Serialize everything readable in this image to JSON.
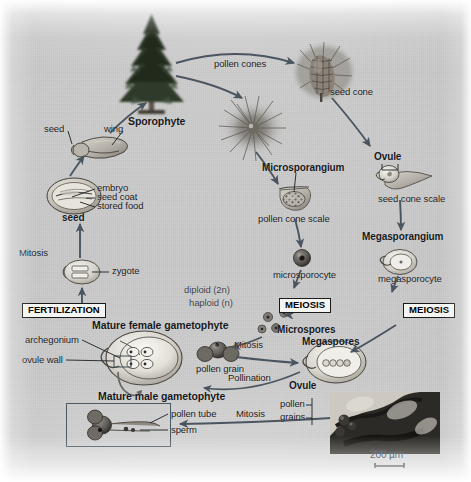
{
  "figure": {
    "background_color": "#c6c6c6",
    "ink_color": "#15171a",
    "arrow_color": "#4a5560"
  },
  "legend": {
    "diploid": "diploid (2n)",
    "haploid": "haploid (n)"
  },
  "stage_boxes": [
    {
      "id": "fertilization",
      "label": "FERTILIZATION"
    },
    {
      "id": "meiosis_male",
      "label": "MEIOSIS"
    },
    {
      "id": "meiosis_female",
      "label": "MEIOSIS"
    }
  ],
  "labels": {
    "sporophyte": "Sporophyte",
    "pollen_cones": "pollen cones",
    "seed_cone": "seed cone",
    "microsporangium": "Microsporangium",
    "pollen_cone_scale": "pollen cone scale",
    "ovule_top": "Ovule",
    "seed_cone_scale": "seed cone scale",
    "megasporangium": "Megasporangium",
    "microsporocyte": "microsporocyte",
    "megasporocyte": "megasporocyte",
    "microspores": "Microspores",
    "megaspores": "Megaspores",
    "mitosis_left": "Mitosis",
    "mitosis_center": "Mitosis",
    "mitosis_bottom": "Mitosis",
    "pollen_grain": "pollen grain",
    "pollination": "Pollination",
    "ovule_bottom": "Ovule",
    "mature_female_gametophyte": "Mature female gametophyte",
    "mature_male_gametophyte": "Mature male gametophyte",
    "archegonium": "archegonium",
    "ovule_wall": "ovule wall",
    "pollen_tube": "pollen tube",
    "sperm": "sperm",
    "pollen_grains": "pollen\ngrains",
    "pollen_grains_line1": "pollen",
    "pollen_grains_line2": "grains",
    "zygote": "zygote",
    "seed": "seed",
    "seed_small": "seed",
    "wing": "wing",
    "embryo": "embryo",
    "seed_coat": "seed coat",
    "stored_food": "stored food",
    "scale_bar": "200 µm"
  },
  "micrograph": {
    "caption": "200 µm",
    "description": "light micrograph of pollen grains on ovule"
  }
}
